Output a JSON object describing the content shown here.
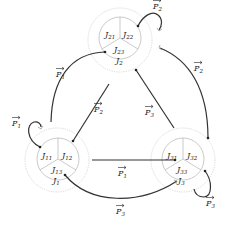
{
  "nodes": [
    {
      "id": "J1",
      "label": "J",
      "sub": "1",
      "parts": [
        {
          "label": "J",
          "sub": "11"
        },
        {
          "label": "J",
          "sub": "12"
        },
        {
          "label": "J",
          "sub": "13"
        }
      ]
    },
    {
      "id": "J2",
      "label": "J",
      "sub": "2",
      "parts": [
        {
          "label": "J",
          "sub": "21"
        },
        {
          "label": "J",
          "sub": "22"
        },
        {
          "label": "J",
          "sub": "23"
        }
      ]
    },
    {
      "id": "J3",
      "label": "J",
      "sub": "3",
      "parts": [
        {
          "label": "J",
          "sub": "31"
        },
        {
          "label": "J",
          "sub": "32"
        },
        {
          "label": "J",
          "sub": "33"
        }
      ]
    }
  ],
  "edges": [
    {
      "from": "J11",
      "to": "J1",
      "label": "P",
      "sub": "1"
    },
    {
      "from": "J1",
      "to": "J21",
      "label": "P",
      "sub": "1"
    },
    {
      "from": "J12",
      "to": "J2",
      "label": "P",
      "sub": "2"
    },
    {
      "from": "J22",
      "to": "J2",
      "label": "P",
      "sub": "2"
    },
    {
      "from": "J32",
      "to": "J2",
      "label": "P",
      "sub": "2"
    },
    {
      "from": "J23",
      "to": "J3",
      "label": "P",
      "sub": "3"
    },
    {
      "from": "J1",
      "to": "J31",
      "label": "P",
      "sub": "1"
    },
    {
      "from": "J13",
      "to": "J3",
      "label": "P",
      "sub": "3"
    },
    {
      "from": "J33",
      "to": "J3",
      "label": "P",
      "sub": "3"
    }
  ]
}
